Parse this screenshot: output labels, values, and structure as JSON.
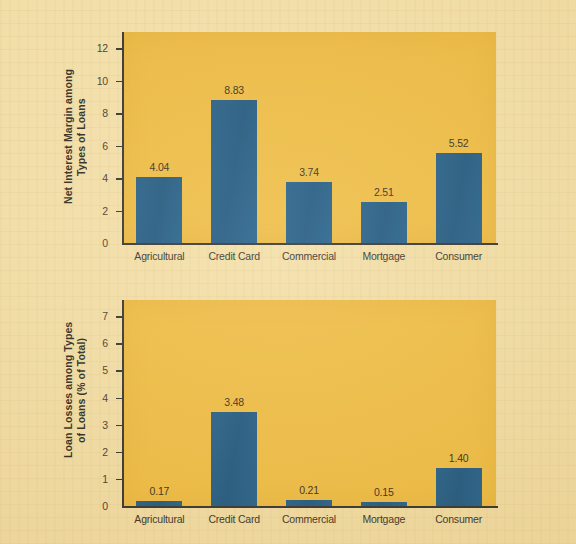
{
  "page": {
    "background_color": "#f3dfa6",
    "plot_background_color": "#eeba3c",
    "bar_color": "#17527c",
    "axis_color": "#2b2b28"
  },
  "chart_data": [
    {
      "type": "bar",
      "id": "net-interest-margin",
      "title": "",
      "xlabel": "",
      "ylabel": "Net Interest Margin among Types of Loans",
      "ylabel_lines": [
        "Net Interest Margin among",
        "Types of Loans"
      ],
      "categories": [
        "Agricultural",
        "Credit Card",
        "Commercial",
        "Mortgage",
        "Consumer"
      ],
      "values": [
        4.04,
        8.83,
        3.74,
        2.51,
        5.52
      ],
      "value_labels": [
        "4.04",
        "8.83",
        "3.74",
        "2.51",
        "5.52"
      ],
      "ylim": [
        0,
        13
      ],
      "yticks": [
        0,
        2,
        4,
        6,
        8,
        10,
        12
      ],
      "ytick_labels": [
        "0",
        "2",
        "4",
        "6",
        "8",
        "10",
        "12"
      ],
      "grid": false,
      "legend": false
    },
    {
      "type": "bar",
      "id": "loan-losses",
      "title": "",
      "xlabel": "",
      "ylabel": "Loan Losses among Types of Loans (% of Total)",
      "ylabel_lines": [
        "Loan Losses among Types",
        "of Loans (% of Total)"
      ],
      "categories": [
        "Agricultural",
        "Credit Card",
        "Commercial",
        "Mortgage",
        "Consumer"
      ],
      "values": [
        0.17,
        3.48,
        0.21,
        0.15,
        1.4
      ],
      "value_labels": [
        "0.17",
        "3.48",
        "0.21",
        "0.15",
        "1.40"
      ],
      "ylim": [
        0,
        7.6
      ],
      "yticks": [
        0,
        1,
        2,
        3,
        4,
        5,
        6,
        7
      ],
      "ytick_labels": [
        "0",
        "1",
        "2",
        "3",
        "4",
        "5",
        "6",
        "7"
      ],
      "grid": false,
      "legend": false
    }
  ]
}
